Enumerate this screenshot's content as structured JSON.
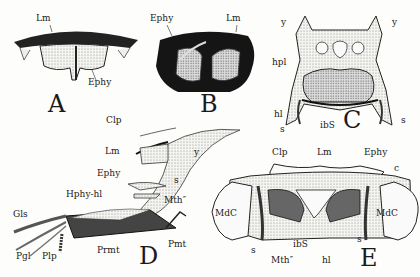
{
  "figure": {
    "panels": [
      {
        "id": "A",
        "labels": [
          "Lm",
          "Ephy"
        ]
      },
      {
        "id": "B",
        "labels": [
          "Ephy",
          "Lm"
        ]
      },
      {
        "id": "C",
        "labels": [
          "y",
          "y",
          "hpl",
          "hl",
          "ibS",
          "s",
          "s"
        ]
      },
      {
        "id": "D",
        "labels": [
          "Clp",
          "Lm",
          "y",
          "Ephy",
          "s",
          "Hphy-hl",
          "Mth″",
          "Gls",
          "Pgl",
          "Plp",
          "Prmt",
          "Pmt"
        ]
      },
      {
        "id": "E",
        "labels": [
          "Clp",
          "Lm",
          "Ephy",
          "c",
          "MdC",
          "MdC",
          "s",
          "s",
          "ibS",
          "Mth″",
          "hl"
        ]
      }
    ]
  },
  "panelA": {
    "letter": "A",
    "lm": "Lm",
    "ephy": "Ephy"
  },
  "panelB": {
    "letter": "B",
    "ephy": "Ephy",
    "lm": "Lm"
  },
  "panelC": {
    "letter": "C",
    "y_left": "y",
    "y_right": "y",
    "hpl": "hpl",
    "hl": "hl",
    "ibs": "ibS",
    "s_left": "s",
    "s_right": "s"
  },
  "panelD": {
    "letter": "D",
    "clp": "Clp",
    "lm": "Lm",
    "y": "y",
    "ephy": "Ephy",
    "s": "s",
    "hphy": "Hphy-hl",
    "mth": "Mth″",
    "gls": "Gls",
    "pgl": "Pgl",
    "plp": "Plp",
    "prmt": "Prmt",
    "pmt": "Pmt"
  },
  "panelE": {
    "letter": "E",
    "clp": "Clp",
    "lm": "Lm",
    "ephy": "Ephy",
    "c": "c",
    "mdc_left": "MdC",
    "mdc_right": "MdC",
    "s_left": "s",
    "s_right": "s",
    "ibs": "ibS",
    "mth": "Mth″",
    "hl": "hl"
  }
}
